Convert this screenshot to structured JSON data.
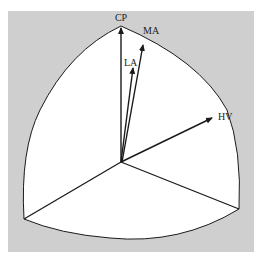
{
  "diagram": {
    "type": "spherical-triangle-vector-diagram",
    "colors": {
      "panel_background": "#cfcfcf",
      "triangle_fill": "#ffffff",
      "stroke": "#1a1a1a",
      "label": "#222222"
    },
    "origin": {
      "x": 121,
      "y": 162
    },
    "vertices": {
      "top": {
        "x": 121,
        "y": 26
      },
      "left": {
        "x": 24,
        "y": 219
      },
      "right": {
        "x": 239,
        "y": 209
      }
    },
    "vectors": [
      {
        "id": "CP",
        "label": "CP",
        "tip": {
          "x": 121,
          "y": 27
        },
        "label_pos": {
          "x": 121,
          "y": 21
        }
      },
      {
        "id": "MA",
        "label": "MA",
        "tip": {
          "x": 143,
          "y": 44
        },
        "label_pos": {
          "x": 150,
          "y": 33
        }
      },
      {
        "id": "LA",
        "label": "LA",
        "tip": {
          "x": 133,
          "y": 67
        },
        "label_pos": {
          "x": 130,
          "y": 65
        }
      },
      {
        "id": "HV",
        "label": "HV",
        "tip": {
          "x": 212,
          "y": 118
        },
        "label_pos": {
          "x": 226,
          "y": 120
        }
      }
    ],
    "labels": {
      "cp": "CP",
      "ma": "MA",
      "la": "LA",
      "hv": "HV"
    }
  }
}
